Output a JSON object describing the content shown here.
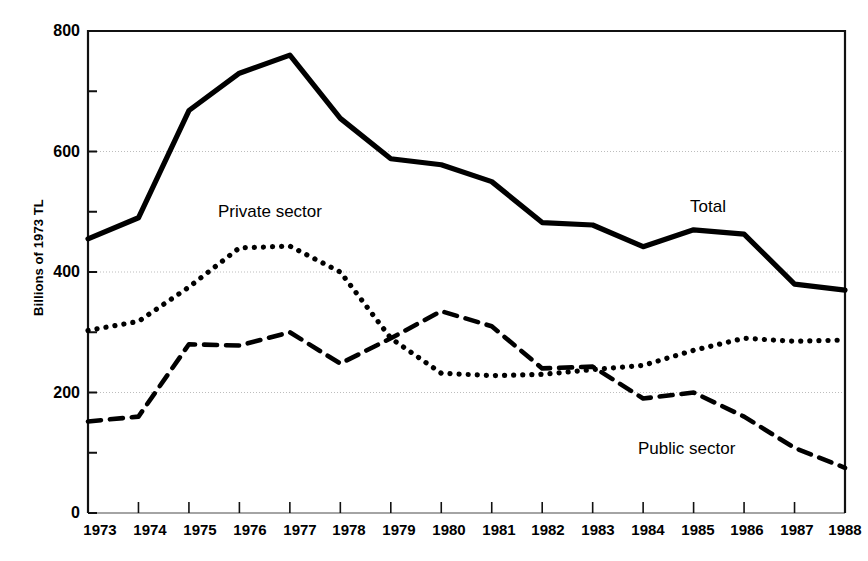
{
  "chart_data": {
    "type": "line",
    "title": "",
    "xlabel": "",
    "ylabel": "Billions of 1973 TL",
    "x": [
      1973,
      1974,
      1975,
      1976,
      1977,
      1978,
      1979,
      1980,
      1981,
      1982,
      1983,
      1984,
      1985,
      1986,
      1987,
      1988
    ],
    "categories": [
      "1973",
      "1974",
      "1975",
      "1976",
      "1977",
      "1978",
      "1979",
      "1980",
      "1981",
      "1982",
      "1983",
      "1984",
      "1985",
      "1986",
      "1987",
      "1988"
    ],
    "xlim": [
      1973,
      1988
    ],
    "ylim": [
      0,
      800
    ],
    "yticks": [
      0,
      200,
      400,
      600,
      800
    ],
    "ytick_labels": [
      "0",
      "200",
      "400",
      "600",
      "800"
    ],
    "yticks_minor": [
      100,
      300,
      500,
      700
    ],
    "grid": "horizontal-major-dotted",
    "legend": "inline-annotations",
    "series": [
      {
        "name": "Total",
        "style": "solid",
        "color": "#000000",
        "label_position": "right-upper",
        "values": [
          455,
          490,
          668,
          730,
          760,
          655,
          588,
          578,
          550,
          482,
          478,
          442,
          470,
          463,
          380,
          370
        ]
      },
      {
        "name": "Private sector",
        "style": "dotted",
        "color": "#000000",
        "label_position": "upper-left",
        "values": [
          303,
          318,
          375,
          440,
          443,
          400,
          290,
          232,
          228,
          230,
          238,
          245,
          270,
          290,
          285,
          287
        ]
      },
      {
        "name": "Public sector",
        "style": "dashed",
        "color": "#000000",
        "label_position": "lower-right",
        "values": [
          152,
          160,
          280,
          278,
          300,
          248,
          290,
          335,
          310,
          240,
          243,
          190,
          200,
          160,
          108,
          75
        ]
      }
    ],
    "annotations": [
      {
        "text": "Private sector",
        "x": 1976,
        "y": 515
      },
      {
        "text": "Total",
        "x": 1986,
        "y": 530
      },
      {
        "text": "Public sector",
        "x": 1985,
        "y": 110
      }
    ]
  },
  "axis": {
    "y_title": "Billions of 1973 TL",
    "y_tick_labels": [
      "800",
      "600",
      "400",
      "200",
      "0"
    ],
    "x_tick_labels": [
      "1973",
      "1974",
      "1975",
      "1976",
      "1977",
      "1978",
      "1979",
      "1980",
      "1981",
      "1982",
      "1983",
      "1984",
      "1985",
      "1986",
      "1987",
      "1988"
    ]
  },
  "labels": {
    "private": "Private sector",
    "total": "Total",
    "public": "Public sector"
  }
}
